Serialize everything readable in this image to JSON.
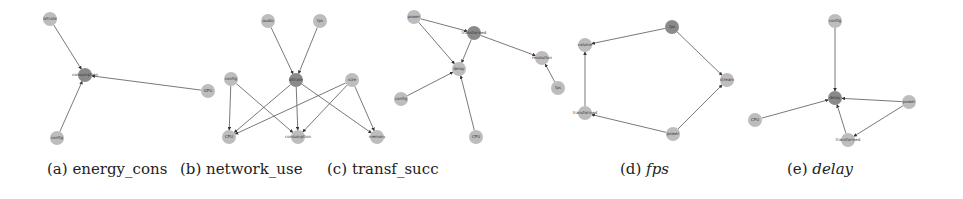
{
  "colors": {
    "node_light": "#bdbdbd",
    "node_dark": "#8a8a8a",
    "edge": "#6a6a6a"
  },
  "panels": [
    {
      "id": "a",
      "caption_prefix": "(a)",
      "caption_name": "energy_cons",
      "italic": false,
      "caption_x": 47,
      "nodes": [
        {
          "id": "bitrate",
          "label": "bitrate",
          "x": 50,
          "y": 19,
          "dark": false
        },
        {
          "id": "consumption",
          "label": "consumption",
          "x": 85,
          "y": 75,
          "dark": true
        },
        {
          "id": "config",
          "label": "config",
          "x": 57,
          "y": 138,
          "dark": false
        },
        {
          "id": "gpu",
          "label": "GPU",
          "x": 208,
          "y": 91,
          "dark": false
        }
      ],
      "edges": [
        [
          "bitrate",
          "consumption"
        ],
        [
          "config",
          "consumption"
        ],
        [
          "gpu",
          "consumption"
        ]
      ]
    },
    {
      "id": "b",
      "caption_prefix": "(b)",
      "caption_name": "network_use",
      "italic": false,
      "caption_x": 180,
      "nodes": [
        {
          "id": "audio",
          "label": "audio",
          "x": 268,
          "y": 21,
          "dark": false
        },
        {
          "id": "fps",
          "label": "fps",
          "x": 320,
          "y": 21,
          "dark": false
        },
        {
          "id": "bitrate",
          "label": "bitrate",
          "x": 296,
          "y": 80,
          "dark": true
        },
        {
          "id": "config",
          "label": "config",
          "x": 231,
          "y": 79,
          "dark": false
        },
        {
          "id": "size",
          "label": "size",
          "x": 352,
          "y": 80,
          "dark": false
        },
        {
          "id": "cpu",
          "label": "CPU",
          "x": 229,
          "y": 137,
          "dark": false
        },
        {
          "id": "consumption",
          "label": "consumption",
          "x": 298,
          "y": 137,
          "dark": false
        },
        {
          "id": "memory",
          "label": "memory",
          "x": 377,
          "y": 137,
          "dark": false
        }
      ],
      "edges": [
        [
          "audio",
          "bitrate"
        ],
        [
          "fps",
          "bitrate"
        ],
        [
          "config",
          "cpu"
        ],
        [
          "config",
          "consumption"
        ],
        [
          "bitrate",
          "cpu"
        ],
        [
          "bitrate",
          "consumption"
        ],
        [
          "bitrate",
          "memory"
        ],
        [
          "size",
          "cpu"
        ],
        [
          "size",
          "consumption"
        ],
        [
          "size",
          "memory"
        ]
      ]
    },
    {
      "id": "c",
      "caption_prefix": "(c)",
      "caption_name": "transf_succ",
      "italic": false,
      "caption_x": 327,
      "nodes": [
        {
          "id": "power",
          "label": "power",
          "x": 414,
          "y": 17,
          "dark": false
        },
        {
          "id": "transformed",
          "label": "transformed",
          "x": 474,
          "y": 33,
          "dark": true
        },
        {
          "id": "delay",
          "label": "delay",
          "x": 459,
          "y": 69,
          "dark": false
        },
        {
          "id": "config",
          "label": "config",
          "x": 401,
          "y": 99,
          "dark": false
        },
        {
          "id": "cpu",
          "label": "CPU",
          "x": 476,
          "y": 137,
          "dark": false
        },
        {
          "id": "resolution",
          "label": "resolution",
          "x": 542,
          "y": 58,
          "dark": false
        },
        {
          "id": "fps",
          "label": "fps",
          "x": 558,
          "y": 88,
          "dark": false
        }
      ],
      "edges": [
        [
          "power",
          "transformed"
        ],
        [
          "power",
          "delay"
        ],
        [
          "transformed",
          "delay"
        ],
        [
          "transformed",
          "resolution"
        ],
        [
          "config",
          "delay"
        ],
        [
          "cpu",
          "delay"
        ],
        [
          "fps",
          "resolution"
        ]
      ]
    },
    {
      "id": "d",
      "caption_prefix": "(d)",
      "caption_name": "fps",
      "italic": true,
      "caption_x": 620,
      "nodes": [
        {
          "id": "fps",
          "label": "fps",
          "x": 672,
          "y": 27,
          "dark": true
        },
        {
          "id": "volume",
          "label": "volume",
          "x": 585,
          "y": 45,
          "dark": false
        },
        {
          "id": "stream",
          "label": "stream",
          "x": 727,
          "y": 80,
          "dark": false
        },
        {
          "id": "transformed",
          "label": "transformed",
          "x": 585,
          "y": 113,
          "dark": false
        },
        {
          "id": "power",
          "label": "power",
          "x": 673,
          "y": 134,
          "dark": false
        }
      ],
      "edges": [
        [
          "fps",
          "volume"
        ],
        [
          "fps",
          "stream"
        ],
        [
          "transformed",
          "volume"
        ],
        [
          "power",
          "transformed"
        ],
        [
          "power",
          "stream"
        ]
      ]
    },
    {
      "id": "e",
      "caption_prefix": "(e)",
      "caption_name": "delay",
      "italic": true,
      "caption_x": 787,
      "nodes": [
        {
          "id": "config",
          "label": "config",
          "x": 835,
          "y": 21,
          "dark": false
        },
        {
          "id": "delay",
          "label": "delay",
          "x": 835,
          "y": 98,
          "dark": true
        },
        {
          "id": "cpu",
          "label": "CPU",
          "x": 755,
          "y": 120,
          "dark": false
        },
        {
          "id": "power",
          "label": "power",
          "x": 909,
          "y": 102,
          "dark": false
        },
        {
          "id": "transformed",
          "label": "transformed",
          "x": 848,
          "y": 140,
          "dark": false
        }
      ],
      "edges": [
        [
          "config",
          "delay"
        ],
        [
          "cpu",
          "delay"
        ],
        [
          "power",
          "delay"
        ],
        [
          "transformed",
          "delay"
        ],
        [
          "power",
          "transformed"
        ]
      ]
    }
  ]
}
